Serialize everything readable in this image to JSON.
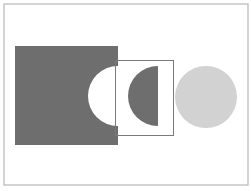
{
  "diagram": {
    "colors": {
      "background": "#ffffff",
      "frame": "#b8b8b8",
      "dark_fill": "#6e6e6e",
      "outline": "#7a7a7a",
      "light_fill": "#d2d2d2"
    },
    "shapes": [
      {
        "id": "dark-square-with-cutout",
        "type": "square",
        "x": 15,
        "y": 46,
        "width": 103,
        "height": 99,
        "cutout": {
          "type": "semicircle",
          "cx": 118,
          "cy": 96,
          "r": 30
        }
      },
      {
        "id": "outline-rectangle",
        "type": "rect-outline",
        "x": 115,
        "y": 60,
        "width": 58,
        "height": 75
      },
      {
        "id": "dark-half-disc",
        "type": "half-circle",
        "cx": 158,
        "cy": 96,
        "r": 30,
        "side": "left"
      },
      {
        "id": "light-circle",
        "type": "circle",
        "cx": 206,
        "cy": 97,
        "r": 31
      }
    ]
  }
}
